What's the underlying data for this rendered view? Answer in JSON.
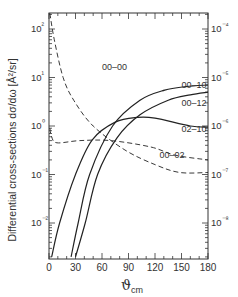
{
  "chart_data": {
    "type": "line",
    "title": "",
    "xlabel": "ϑcm",
    "xlabel_main": "ϑ",
    "xlabel_sub": "cm",
    "ylabel": "Differential cross-sections dσ/dω [Å²/sr]",
    "xlim": [
      0,
      180
    ],
    "ylim_left": [
      0.0018,
      215
    ],
    "yscale": "log",
    "xticks": [
      0,
      30,
      60,
      90,
      120,
      150,
      180
    ],
    "yticks_left": [
      {
        "value": 100,
        "label": "10²"
      },
      {
        "value": 10,
        "label": "10¹"
      },
      {
        "value": 1,
        "label": "10⁰"
      },
      {
        "value": 0.1,
        "label": "10⁻¹"
      },
      {
        "value": 0.01,
        "label": "10⁻²"
      }
    ],
    "yticks_right": [
      {
        "value": 100,
        "label": "10⁻⁴"
      },
      {
        "value": 10,
        "label": "10⁻⁵"
      },
      {
        "value": 1,
        "label": "10⁻⁶"
      },
      {
        "value": 0.1,
        "label": "10⁻⁷"
      },
      {
        "value": 0.01,
        "label": "10⁻⁸"
      }
    ],
    "grid": false,
    "legend": "inline labels",
    "series": [
      {
        "name": "00-00",
        "style": "dashed",
        "label_pos": [
          60,
          14
        ],
        "x": [
          1,
          6,
          16,
          28,
          50,
          86,
          120,
          148,
          180
        ],
        "y": [
          210,
          60,
          10,
          3.4,
          1.0,
          0.32,
          0.16,
          0.11,
          0.11
        ]
      },
      {
        "name": "00-02",
        "style": "dashed",
        "label_pos": [
          125,
          0.22
        ],
        "x": [
          1,
          3,
          9,
          35,
          70,
          115,
          143,
          180
        ],
        "y": [
          0.9,
          0.6,
          0.45,
          0.5,
          0.5,
          0.37,
          0.25,
          0.2
        ]
      },
      {
        "name": "02-10",
        "style": "solid",
        "label_pos": [
          150,
          0.75
        ],
        "x": [
          3,
          12,
          30,
          49,
          75,
          100,
          120,
          160,
          180
        ],
        "y": [
          0.002,
          0.01,
          0.1,
          0.52,
          1.2,
          1.5,
          1.45,
          1.0,
          0.95
        ]
      },
      {
        "name": "00-10",
        "style": "solid",
        "label_pos": [
          150,
          6
        ],
        "x": [
          25,
          33,
          46,
          72,
          103,
          131,
          155,
          180
        ],
        "y": [
          0.002,
          0.01,
          0.1,
          1.0,
          3.4,
          5.5,
          6.5,
          7
        ]
      },
      {
        "name": "00-12",
        "style": "solid",
        "label_pos": [
          150,
          2.6
        ],
        "x": [
          30,
          41,
          55,
          77,
          103,
          135,
          160,
          180
        ],
        "y": [
          0.002,
          0.01,
          0.1,
          0.57,
          1.7,
          3.4,
          4.4,
          5
        ]
      }
    ]
  }
}
